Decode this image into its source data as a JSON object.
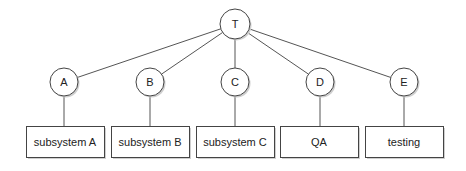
{
  "diagram": {
    "type": "tree",
    "root": {
      "id": "T",
      "label": "T",
      "cx": 235,
      "cy": 24,
      "r": 15
    },
    "children": [
      {
        "id": "A",
        "label": "A",
        "cx": 64,
        "cy": 82,
        "r": 14,
        "box": {
          "label": "subsystem A",
          "x": 26,
          "y": 126,
          "w": 78,
          "h": 31
        }
      },
      {
        "id": "B",
        "label": "B",
        "cx": 150,
        "cy": 82,
        "r": 14,
        "box": {
          "label": "subsystem B",
          "x": 111,
          "y": 126,
          "w": 78,
          "h": 31
        }
      },
      {
        "id": "C",
        "label": "C",
        "cx": 235,
        "cy": 82,
        "r": 14,
        "box": {
          "label": "subsystem C",
          "x": 196,
          "y": 126,
          "w": 78,
          "h": 31
        }
      },
      {
        "id": "D",
        "label": "D",
        "cx": 320,
        "cy": 82,
        "r": 14,
        "box": {
          "label": "QA",
          "x": 280,
          "y": 126,
          "w": 78,
          "h": 31
        }
      },
      {
        "id": "E",
        "label": "E",
        "cx": 404,
        "cy": 82,
        "r": 14,
        "box": {
          "label": "testing",
          "x": 365,
          "y": 126,
          "w": 78,
          "h": 31
        }
      }
    ],
    "colors": {
      "stroke": "#444444",
      "edge": "#555555",
      "fill": "#ffffff",
      "shadow": "#cfcfcf",
      "text": "#222222"
    }
  }
}
